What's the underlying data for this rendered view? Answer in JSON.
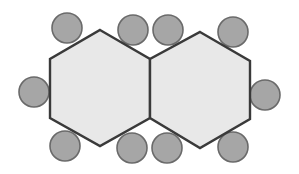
{
  "diagram": {
    "colors": {
      "background": "#ffffff",
      "hexagon_fill": "#e8e8e8",
      "hexagon_stroke": "#3a3a3a",
      "circle_fill": "#a6a6a6",
      "circle_stroke": "#6a6a6a"
    },
    "hexagons": [
      {
        "id": "left",
        "points": "100,30 150,59 150,118 100,146 50,118 50,59"
      },
      {
        "id": "right",
        "points": "200,32 250,61 250,119 200,148 150,118 150,59"
      }
    ],
    "circles": [
      {
        "id": "c1",
        "cx": 67,
        "cy": 28,
        "r": 15
      },
      {
        "id": "c2",
        "cx": 133,
        "cy": 30,
        "r": 15
      },
      {
        "id": "c3",
        "cx": 168,
        "cy": 30,
        "r": 15
      },
      {
        "id": "c4",
        "cx": 233,
        "cy": 32,
        "r": 15
      },
      {
        "id": "c5",
        "cx": 34,
        "cy": 92,
        "r": 15
      },
      {
        "id": "c6",
        "cx": 265,
        "cy": 95,
        "r": 15
      },
      {
        "id": "c7",
        "cx": 65,
        "cy": 146,
        "r": 15
      },
      {
        "id": "c8",
        "cx": 132,
        "cy": 148,
        "r": 15
      },
      {
        "id": "c9",
        "cx": 167,
        "cy": 148,
        "r": 15
      },
      {
        "id": "c10",
        "cx": 233,
        "cy": 147,
        "r": 15
      }
    ]
  }
}
